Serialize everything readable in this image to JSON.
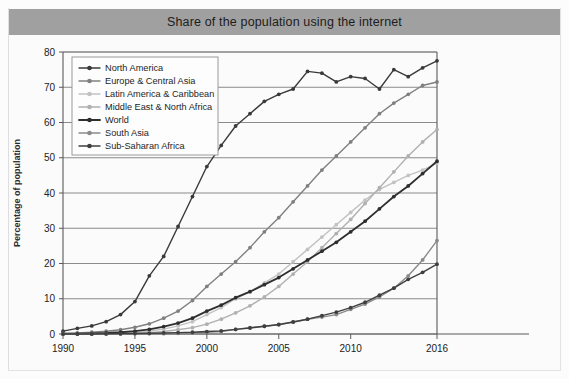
{
  "header": {
    "title": "Share of the population using the internet"
  },
  "chart_data": {
    "type": "line",
    "title": "Share of the population using the internet",
    "xlabel": "",
    "ylabel": "Percentage of population",
    "xlim": [
      1990,
      2016
    ],
    "ylim": [
      0,
      80
    ],
    "ytick_values": [
      0,
      10,
      20,
      30,
      40,
      50,
      60,
      70,
      80
    ],
    "xtick_values": [
      1990,
      1995,
      2000,
      2005,
      2010,
      2016
    ],
    "xtick_labels": [
      "1990",
      "1995",
      "2000",
      "2005",
      "2010",
      "2016"
    ],
    "ytick_labels": [
      "0",
      "10",
      "20",
      "30",
      "40",
      "50",
      "60",
      "70",
      "80"
    ],
    "grid": true,
    "legend_position": "upper left",
    "x": [
      1990,
      1991,
      1992,
      1993,
      1994,
      1995,
      1996,
      1997,
      1998,
      1999,
      2000,
      2001,
      2002,
      2003,
      2004,
      2005,
      2006,
      2007,
      2008,
      2009,
      2010,
      2011,
      2012,
      2013,
      2014,
      2015,
      2016
    ],
    "series": [
      {
        "name": "North America",
        "color": "#3a3a3a",
        "width": 1.4,
        "values": [
          0.8,
          1.6,
          2.3,
          3.5,
          5.5,
          9.2,
          16.5,
          22.0,
          30.5,
          39.0,
          47.5,
          53.5,
          59.0,
          62.5,
          66.0,
          68.0,
          69.5,
          74.5,
          74.0,
          71.5,
          73.0,
          72.5,
          69.5,
          75.0,
          73.0,
          75.5,
          77.5
        ]
      },
      {
        "name": "Europe & Central Asia",
        "color": "#808080",
        "width": 1.4,
        "values": [
          0.2,
          0.3,
          0.5,
          0.8,
          1.2,
          1.9,
          2.9,
          4.5,
          6.5,
          9.5,
          13.5,
          17.0,
          20.5,
          24.5,
          29.0,
          33.0,
          37.5,
          42.0,
          46.5,
          50.5,
          54.5,
          58.5,
          62.5,
          65.5,
          68.0,
          70.5,
          71.5
        ]
      },
      {
        "name": "Latin America & Caribbean",
        "color": "#c2c2c2",
        "width": 1.4,
        "values": [
          0.0,
          0.0,
          0.1,
          0.1,
          0.2,
          0.4,
          0.8,
          1.4,
          2.3,
          3.5,
          5.5,
          7.5,
          10.0,
          12.0,
          14.5,
          17.0,
          20.5,
          24.0,
          27.5,
          31.0,
          34.5,
          38.0,
          41.0,
          43.0,
          45.0,
          46.5,
          48.5
        ]
      },
      {
        "name": "Middle East & North Africa",
        "color": "#b0b0b0",
        "width": 1.4,
        "values": [
          0.0,
          0.0,
          0.0,
          0.1,
          0.1,
          0.2,
          0.4,
          0.7,
          1.2,
          1.8,
          2.8,
          4.2,
          6.0,
          8.0,
          10.5,
          13.5,
          17.0,
          20.5,
          24.5,
          28.5,
          32.5,
          37.0,
          41.5,
          46.0,
          50.5,
          54.5,
          58.0
        ]
      },
      {
        "name": "World",
        "color": "#2e2e2e",
        "width": 1.8,
        "values": [
          0.05,
          0.1,
          0.2,
          0.3,
          0.5,
          0.8,
          1.3,
          2.1,
          3.1,
          4.5,
          6.5,
          8.2,
          10.3,
          12.0,
          14.0,
          16.0,
          18.5,
          21.0,
          23.5,
          26.0,
          29.0,
          32.0,
          35.5,
          39.0,
          42.0,
          45.5,
          49.0
        ]
      },
      {
        "name": "South Asia",
        "color": "#8a8a8a",
        "width": 1.4,
        "values": [
          0.0,
          0.0,
          0.0,
          0.0,
          0.0,
          0.05,
          0.1,
          0.1,
          0.2,
          0.3,
          0.5,
          0.7,
          1.3,
          1.8,
          2.2,
          2.6,
          3.4,
          4.2,
          4.8,
          5.5,
          7.0,
          8.5,
          10.5,
          13.0,
          16.5,
          21.0,
          26.5
        ]
      },
      {
        "name": "Sub-Saharan Africa",
        "color": "#3f3f3f",
        "width": 1.4,
        "values": [
          0.0,
          0.0,
          0.0,
          0.05,
          0.1,
          0.15,
          0.2,
          0.3,
          0.4,
          0.5,
          0.7,
          0.9,
          1.3,
          1.7,
          2.2,
          2.7,
          3.4,
          4.2,
          5.2,
          6.2,
          7.5,
          9.0,
          11.0,
          13.0,
          15.5,
          17.5,
          19.8
        ]
      }
    ]
  }
}
